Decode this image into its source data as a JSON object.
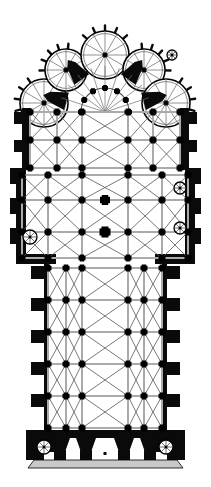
{
  "document": {
    "kind": "architectural-floor-plan",
    "subject": "Gothic cathedral ground plan",
    "orientation": "apse at top, west facade at bottom",
    "background_color": "#ffffff",
    "ink_color": "#000000",
    "rib_color": "#4a4a4a",
    "wall_fill_color": "#111111",
    "light_wall_color": "#b8b8b8",
    "canvas": {
      "width": 211,
      "height": 487
    }
  },
  "palette": {
    "masonry_black": "#0a0a0a",
    "pier_black": "#000000",
    "rib_gray": "#555555",
    "thin_rib_gray": "#6d6d6d",
    "wall_gray": "#aaaaaa",
    "step_gray": "#c9c9c9",
    "outline": "#000000",
    "paper": "#ffffff"
  },
  "plan": {
    "axis_x": 105,
    "nave": {
      "label": "nave",
      "left": 48,
      "right": 162,
      "top": 262,
      "bottom": 432,
      "bay_count": 5,
      "bay_ys": [
        268,
        300,
        332,
        364,
        396,
        428
      ],
      "aisle_left_x": 66,
      "aisle_right_x": 144,
      "buttress_ys": [
        272,
        304,
        336,
        368,
        400
      ],
      "buttress_w": 14,
      "buttress_h": 13
    },
    "transept": {
      "label": "transept",
      "left": 22,
      "right": 188,
      "top": 168,
      "bottom": 262,
      "crossing_y": 232,
      "arm_bay_ys": [
        175,
        200,
        232,
        258
      ]
    },
    "choir": {
      "label": "choir",
      "left": 30,
      "right": 180,
      "top": 108,
      "bottom": 168,
      "bay_ys": [
        112,
        140,
        168
      ]
    },
    "ambulatory": {
      "label": "ambulatory",
      "center_x": 105,
      "center_y": 112,
      "inner_radius": 24,
      "outer_radius": 46
    },
    "chapels": {
      "label": "radiating chapels",
      "count": 5,
      "items": [
        {
          "name": "chapel-nw-outer",
          "cx": 44,
          "cy": 103,
          "r": 24,
          "spokes": 12
        },
        {
          "name": "chapel-nw-inner",
          "cx": 66,
          "cy": 70,
          "r": 21,
          "spokes": 12
        },
        {
          "name": "chapel-axial",
          "cx": 105,
          "cy": 55,
          "r": 24,
          "spokes": 12
        },
        {
          "name": "chapel-ne-inner",
          "cx": 144,
          "cy": 70,
          "r": 21,
          "spokes": 12
        },
        {
          "name": "chapel-ne-outer",
          "cx": 166,
          "cy": 103,
          "r": 24,
          "spokes": 12
        }
      ]
    },
    "buttress_spikes": {
      "label": "exterior buttress spikes on chapel ring",
      "count": 18
    },
    "piers": {
      "label": "compound piers",
      "nave_arcade_left_x": 82,
      "nave_arcade_right_x": 128,
      "crossing_pier_size": 11,
      "standard_pier_size": 7,
      "small_pier_size": 5
    },
    "west_facade": {
      "label": "west facade",
      "top": 432,
      "bottom": 462,
      "left": 26,
      "right": 184,
      "tower_left_x": 42,
      "tower_right_x": 168,
      "portal_pier_xs": [
        60,
        86,
        124,
        150
      ],
      "step_top": 460,
      "step_bottom": 468
    },
    "stair_turrets": {
      "label": "spiral stair turrets",
      "items": [
        {
          "name": "stair-transept-left",
          "cx": 30,
          "cy": 237,
          "r": 7
        },
        {
          "name": "stair-transept-right-up",
          "cx": 180,
          "cy": 188,
          "r": 6
        },
        {
          "name": "stair-transept-right-lo",
          "cx": 180,
          "cy": 228,
          "r": 6
        },
        {
          "name": "stair-facade-left",
          "cx": 44,
          "cy": 447,
          "r": 7
        },
        {
          "name": "stair-facade-right",
          "cx": 166,
          "cy": 447,
          "r": 7
        },
        {
          "name": "stair-chevet-right",
          "cx": 172,
          "cy": 55,
          "r": 5
        }
      ]
    }
  }
}
